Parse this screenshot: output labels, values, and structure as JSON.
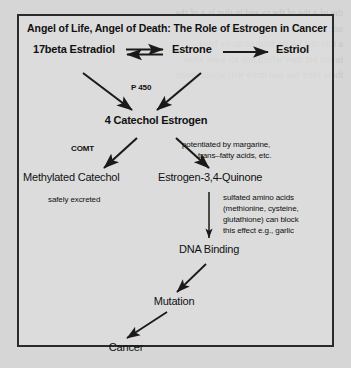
{
  "document": {
    "title": "Angel of Life, Angel of Death: The Role of Estrogen in Cancer",
    "background_color": "#d6d6d6",
    "frame_color": "#2b2b2b",
    "text_color": "#111111"
  },
  "nodes": {
    "estradiol": "17beta Estradiol",
    "estrone": "Estrone",
    "estriol": "Estriol",
    "catechol_estrogen": "4 Catechol Estrogen",
    "methylated_catechol": "Methylated Catechol",
    "quinone": "Estrogen-3,4-Quinone",
    "dna_binding": "DNA Binding",
    "mutation": "Mutation",
    "cancer": "Cancer"
  },
  "annotations": {
    "p450": "P 450",
    "comt": "COMT",
    "safely_excreted": "safely excreted",
    "potentiated_line1": "potentiated by margarine,",
    "potentiated_line2": "trans–fatty acids, etc.",
    "sulfated_line1": "sulfated amino acids",
    "sulfated_line2": "(methionine, cysteine,",
    "sulfated_line3": "glutathione) can block",
    "sulfated_line4": "this effect e.g., garlic"
  },
  "bleed_through": "the of a the of the to and in that is a of the\nnot a the of and in it as the for with on\na this that be are from or an by have\nto not but they which one all were when\nthere their has had more will would about"
}
